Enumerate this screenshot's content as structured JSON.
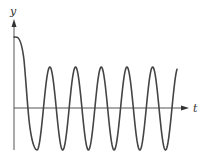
{
  "chart_data": {
    "type": "line",
    "title": "",
    "xlabel": "t",
    "ylabel": "y",
    "grid": false,
    "legend": null,
    "initial_value": 1.75,
    "oscillation": {
      "amplitude": 1.0,
      "center": 0.0,
      "visible_peaks": 5,
      "visible_troughs": 6
    },
    "series": [
      {
        "name": "y(t)",
        "points_px": [
          [
            14,
            37
          ],
          [
            18,
            38
          ],
          [
            21,
            45
          ],
          [
            24,
            65
          ],
          [
            27,
            108
          ],
          [
            31,
            135
          ],
          [
            37,
            150
          ],
          [
            43,
            135
          ],
          [
            48,
            108
          ],
          [
            49,
            67
          ]
        ]
      }
    ]
  },
  "axes": {
    "x_label": "t",
    "y_label": "y",
    "color": "#444444"
  },
  "curve": {
    "color": "#444444"
  }
}
